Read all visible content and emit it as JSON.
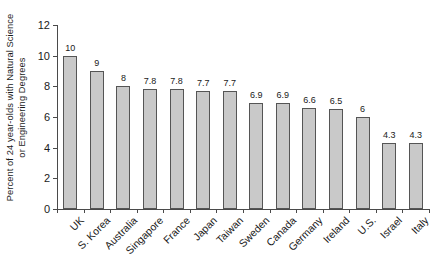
{
  "chart_data": {
    "type": "bar",
    "title": "",
    "subtitle": "",
    "xlabel": "",
    "ylabel": "Percent of 24 year-olds with Natural Science or Engineering Degrees",
    "ylabel_lines": [
      "Percent of 24 year-olds with Natural Science",
      "or Engineering Degrees"
    ],
    "categories": [
      "UK",
      "S. Korea",
      "Australia",
      "Singapore",
      "France",
      "Japan",
      "Taiwan",
      "Sweden",
      "Canada",
      "Germany",
      "Ireland",
      "U.S.",
      "Israel",
      "Italy"
    ],
    "values": [
      10,
      9,
      8,
      7.8,
      7.8,
      7.7,
      7.7,
      6.9,
      6.9,
      6.6,
      6.5,
      6,
      4.3,
      4.3
    ],
    "value_labels": [
      "10",
      "9",
      "8",
      "7.8",
      "7.8",
      "7.7",
      "7.7",
      "6.9",
      "6.9",
      "6.6",
      "6.5",
      "6",
      "4.3",
      "4.3"
    ],
    "ylim": [
      0,
      12
    ],
    "yticks": [
      0,
      2,
      4,
      6,
      8,
      10,
      12
    ],
    "ytick_labels": [
      "0",
      "2",
      "4",
      "6",
      "8",
      "10",
      "12"
    ],
    "grid": false,
    "legend": null,
    "legend_position": "none",
    "bar_fill_color": "#c9c9c9",
    "bar_edge_color": "#555555",
    "axis_color": "#4a4a4a",
    "text_color": "#1a1a1a",
    "background_color": "#ffffff",
    "xlabel_rotation_deg": 45,
    "data_labels_shown": true
  }
}
